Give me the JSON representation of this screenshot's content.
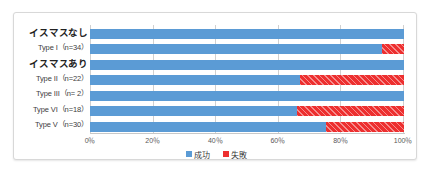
{
  "chart_data": {
    "type": "bar",
    "subtype": "stacked-horizontal-100-percent",
    "title": "",
    "xlabel": "",
    "ylabel": "",
    "xlim": [
      0,
      100
    ],
    "grid": true,
    "grid_axis": "x",
    "legend_position": "bottom-center",
    "categories": [
      "イスマスなし",
      "Type I（n=34）",
      "イスマスあり",
      "Type II（n=22）",
      "Type III（n= 2）",
      "Type VI（n=18）",
      "Type V（n=30）"
    ],
    "category_kinds": [
      "group",
      "item",
      "group",
      "item",
      "item",
      "item",
      "item"
    ],
    "series": [
      {
        "name": "成功",
        "color": "#5b9bd5",
        "values": [
          100,
          93,
          100,
          67,
          100,
          66,
          75
        ]
      },
      {
        "name": "失敗",
        "color": "#ed2f2f",
        "values": [
          0,
          7,
          0,
          33,
          0,
          34,
          25
        ]
      }
    ],
    "xticks": [
      0,
      20,
      40,
      60,
      80,
      100
    ],
    "xticklabels": [
      "0％",
      "20％",
      "40％",
      "60％",
      "80％",
      "100％"
    ]
  },
  "rows": [
    {
      "label": "イスマスなし",
      "kind": "group",
      "success": 100,
      "failure": 0
    },
    {
      "label": "Type I（n=34）",
      "kind": "item",
      "success": 93,
      "failure": 7
    },
    {
      "label": "イスマスあり",
      "kind": "group",
      "success": 100,
      "failure": 0
    },
    {
      "label": "Type II（n=22）",
      "kind": "item",
      "success": 67,
      "failure": 33
    },
    {
      "label": "Type III（n= 2）",
      "kind": "item",
      "success": 100,
      "failure": 0
    },
    {
      "label": "Type VI（n=18）",
      "kind": "item",
      "success": 66,
      "failure": 34
    },
    {
      "label": "Type V（n=30）",
      "kind": "item",
      "success": 75,
      "failure": 25
    }
  ],
  "xaxis": {
    "ticks": [
      {
        "value": 0,
        "label": "0％"
      },
      {
        "value": 20,
        "label": "20％"
      },
      {
        "value": 40,
        "label": "40％"
      },
      {
        "value": 60,
        "label": "60％"
      },
      {
        "value": 80,
        "label": "80％"
      },
      {
        "value": 100,
        "label": "100％"
      }
    ]
  },
  "legend": {
    "items": [
      {
        "label": "成功",
        "color": "#5b9bd5"
      },
      {
        "label": "失敗",
        "color": "#ed2f2f"
      }
    ]
  },
  "colors": {
    "success": "#5b9bd5",
    "failure": "#ed2f2f",
    "grid": "#d0d0d0",
    "border": "#d8d8d8",
    "background": "#ffffff"
  }
}
